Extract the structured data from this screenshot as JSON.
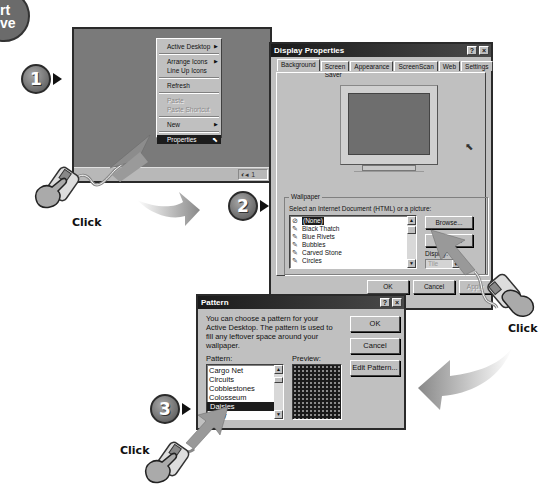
{
  "corner_badge": {
    "text": "rt\nve"
  },
  "steps": [
    {
      "number": "1"
    },
    {
      "number": "2"
    },
    {
      "number": "3"
    }
  ],
  "click_labels": [
    "Click",
    "Click",
    "Click"
  ],
  "desktop": {
    "context_menu": {
      "items": [
        {
          "label": "Active Desktop",
          "submenu": true,
          "state": "normal"
        },
        {
          "label": "Arrange Icons",
          "submenu": true,
          "state": "normal"
        },
        {
          "label": "Line Up Icons",
          "submenu": false,
          "state": "normal"
        },
        {
          "label": "Refresh",
          "submenu": false,
          "state": "normal"
        },
        {
          "label": "Paste",
          "submenu": false,
          "state": "disabled"
        },
        {
          "label": "Paste Shortcut",
          "submenu": false,
          "state": "disabled"
        },
        {
          "label": "New",
          "submenu": true,
          "state": "normal"
        },
        {
          "label": "Properties",
          "submenu": false,
          "state": "selected"
        }
      ]
    },
    "tray_text": "◐◂ 1"
  },
  "display_properties": {
    "title": "Display Properties",
    "help_btn": "?",
    "close_btn": "×",
    "tabs": [
      "Background",
      "Screen Saver",
      "Appearance",
      "ScreenScan",
      "Web",
      "Settings"
    ],
    "active_tab": "Background",
    "wallpaper_group": "Wallpaper",
    "select_label": "Select an Internet Document (HTML) or a picture:",
    "wallpaper_list": [
      {
        "label": "(None)",
        "selected": true,
        "icon": "none-icon"
      },
      {
        "label": "Black Thatch",
        "selected": false,
        "icon": "wallpaper-icon"
      },
      {
        "label": "Blue Rivets",
        "selected": false,
        "icon": "wallpaper-icon"
      },
      {
        "label": "Bubbles",
        "selected": false,
        "icon": "wallpaper-icon"
      },
      {
        "label": "Carved Stone",
        "selected": false,
        "icon": "wallpaper-icon"
      },
      {
        "label": "Circles",
        "selected": false,
        "icon": "wallpaper-icon"
      }
    ],
    "browse_btn": "Browse...",
    "pattern_btn": "Pattern...",
    "display_label": "Display:",
    "display_value": "Tile",
    "ok_btn": "OK",
    "cancel_btn": "Cancel",
    "apply_btn": "Apply"
  },
  "pattern_dialog": {
    "title": "Pattern",
    "help_btn": "?",
    "close_btn": "×",
    "description": "You can choose a pattern for your Active Desktop.  The pattern is used to fill any leftover space around your wallpaper.",
    "pattern_label": "Pattern:",
    "preview_label": "Preview:",
    "pattern_list": [
      {
        "label": "Cargo Net",
        "selected": false
      },
      {
        "label": "Circuits",
        "selected": false
      },
      {
        "label": "Cobblestones",
        "selected": false
      },
      {
        "label": "Colosseum",
        "selected": false
      },
      {
        "label": "Daisies",
        "selected": true
      },
      {
        "label": "Fizzy",
        "selected": false
      }
    ],
    "ok_btn": "OK",
    "cancel_btn": "Cancel",
    "edit_pattern_btn": "Edit Pattern..."
  }
}
